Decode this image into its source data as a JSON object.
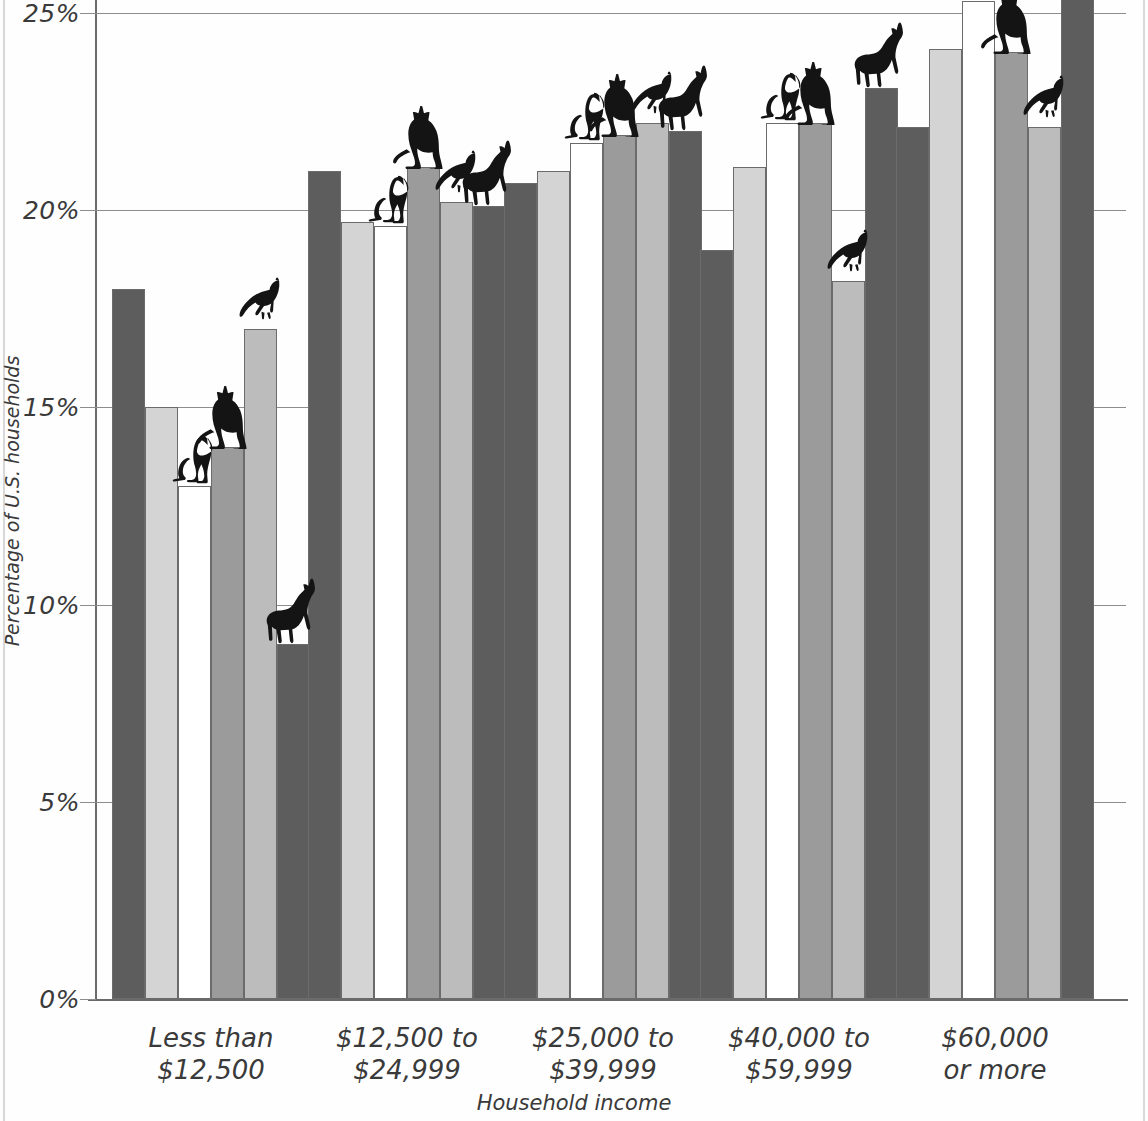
{
  "chart_data": {
    "type": "bar",
    "title": "",
    "xlabel": "Household income",
    "ylabel": "Percentage of U.S. households",
    "ylim": [
      0,
      25
    ],
    "ytick_labels": [
      "0%",
      "5%",
      "10%",
      "15%",
      "20%",
      "25%"
    ],
    "ytick_values": [
      0,
      5,
      10,
      15,
      20,
      25
    ],
    "grid": true,
    "legend_position": "none",
    "categories": [
      "Less than $12,500",
      "$12,500 to $24,999",
      "$25,000 to $39,999",
      "$40,000 to $59,999",
      "$60,000 or more"
    ],
    "category_lines": [
      [
        "Less than",
        "$12,500"
      ],
      [
        "$12,500 to",
        "$24,999"
      ],
      [
        "$25,000 to",
        "$39,999"
      ],
      [
        "$40,000 to",
        "$59,999"
      ],
      [
        "$60,000",
        "or more"
      ]
    ],
    "series": [
      {
        "name": "bar-1",
        "color": "#5d5d5d",
        "values": [
          18.0,
          21.0,
          20.7,
          19.0,
          22.1
        ]
      },
      {
        "name": "bar-2",
        "color": "#d4d4d4",
        "values": [
          15.0,
          19.7,
          21.0,
          21.1,
          24.1
        ]
      },
      {
        "name": "bar-3",
        "color": "#ffffff",
        "values": [
          13.0,
          19.6,
          21.7,
          22.2,
          25.3
        ]
      },
      {
        "name": "bar-4",
        "color": "#9b9b9b",
        "values": [
          14.0,
          21.1,
          21.9,
          22.2,
          24.0
        ]
      },
      {
        "name": "bar-5",
        "color": "#bcbcbc",
        "values": [
          17.0,
          20.2,
          22.2,
          18.2,
          22.1
        ]
      },
      {
        "name": "bar-6",
        "color": "#5d5d5d",
        "values": [
          9.0,
          20.1,
          22.0,
          23.1,
          26.0
        ]
      }
    ],
    "animal_markers": [
      {
        "group": 0,
        "bar": 2,
        "animal": "dog"
      },
      {
        "group": 0,
        "bar": 3,
        "animal": "cat"
      },
      {
        "group": 0,
        "bar": 4,
        "animal": "bird"
      },
      {
        "group": 0,
        "bar": 5,
        "animal": "horse"
      },
      {
        "group": 1,
        "bar": 2,
        "animal": "dog"
      },
      {
        "group": 1,
        "bar": 3,
        "animal": "cat"
      },
      {
        "group": 1,
        "bar": 4,
        "animal": "bird"
      },
      {
        "group": 1,
        "bar": 5,
        "animal": "horse"
      },
      {
        "group": 2,
        "bar": 2,
        "animal": "dog"
      },
      {
        "group": 2,
        "bar": 3,
        "animal": "cat"
      },
      {
        "group": 2,
        "bar": 4,
        "animal": "bird"
      },
      {
        "group": 2,
        "bar": 5,
        "animal": "horse"
      },
      {
        "group": 3,
        "bar": 2,
        "animal": "dog"
      },
      {
        "group": 3,
        "bar": 3,
        "animal": "cat"
      },
      {
        "group": 3,
        "bar": 4,
        "animal": "bird"
      },
      {
        "group": 3,
        "bar": 5,
        "animal": "horse"
      },
      {
        "group": 4,
        "bar": 2,
        "animal": "dog"
      },
      {
        "group": 4,
        "bar": 3,
        "animal": "cat"
      },
      {
        "group": 4,
        "bar": 4,
        "animal": "bird"
      },
      {
        "group": 4,
        "bar": 5,
        "animal": "horse"
      }
    ]
  },
  "axis": {
    "y_title": "Percentage of U.S. households",
    "x_title": "Household income",
    "ticks": [
      "25%",
      "20%",
      "15%",
      "10%",
      "5%",
      "0%"
    ]
  },
  "colors": {
    "bar_dark": "#5d5d5d",
    "bar_light": "#d4d4d4",
    "bar_white": "#ffffff",
    "bar_mid": "#9b9b9b",
    "bar_midlight": "#bcbcbc",
    "gridline": "#8d8d8d",
    "text": "#3a3a3a",
    "animal_silhouette": "#1a1a1a"
  }
}
